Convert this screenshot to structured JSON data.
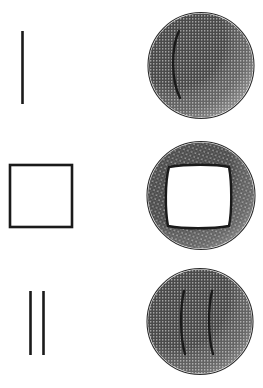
{
  "figure": {
    "width": 263,
    "height": 388,
    "background_color": "#ffffff",
    "ink_color": "#1a1a1a",
    "stipple_color": "#4a4a4a",
    "outline_color": "#2b2b2b",
    "rows": [
      {
        "id": "row-1",
        "label": "single-stroke",
        "left_mark": {
          "name": "single-vertical-line",
          "type": "line",
          "count": 1,
          "x1": 22.5,
          "y1": 31,
          "x2": 22.5,
          "y2": 104,
          "stroke_width": 2.6
        },
        "right_sphere": {
          "name": "sphere-single-stroke",
          "cx": 201,
          "cy": 65.5,
          "r": 53,
          "outline_width": 1.1,
          "interior_marks": [
            {
              "type": "arc",
              "d": "M 179,31 C 171,48 171,80 180,98",
              "stroke_width": 2.4
            }
          ],
          "shading": {
            "style": "stipple",
            "lit_side": "left",
            "shadow_side": "right-bottom",
            "density": "heavy"
          }
        }
      },
      {
        "id": "row-2",
        "label": "square-outline",
        "left_mark": {
          "name": "square-outline",
          "type": "rect",
          "x": 10,
          "y": 165,
          "width": 62,
          "height": 62,
          "stroke_width": 2.6
        },
        "right_sphere": {
          "name": "sphere-square-impression",
          "cx": 201,
          "cy": 195.5,
          "r": 54,
          "outline_width": 1.1,
          "interior_marks": [
            {
              "type": "rounded-square",
              "d": "M 169,167 C 186,164 216,164 229,167 C 232,183 232,211 229,226 C 212,229 184,229 168,226 C 165,210 165,182 169,167 Z",
              "stroke_width": 2.4
            }
          ],
          "shading": {
            "style": "stipple",
            "lit_side": "left",
            "shadow_side": "right-bottom",
            "density": "heavy"
          }
        }
      },
      {
        "id": "row-3",
        "label": "double-stroke",
        "left_mark": {
          "name": "double-vertical-lines",
          "type": "line",
          "count": 2,
          "x1": 30.5,
          "y1": 291,
          "x2": 30.5,
          "y2": 355,
          "x3": 43.5,
          "y3": 291,
          "x4": 43.5,
          "y4": 355,
          "stroke_width": 2.6
        },
        "right_sphere": {
          "name": "sphere-double-stroke",
          "cx": 200,
          "cy": 321.5,
          "r": 53,
          "outline_width": 1.1,
          "interior_marks": [
            {
              "type": "arc",
              "d": "M 184,291 C 180,308 180,337 185,354",
              "stroke_width": 2.4
            },
            {
              "type": "arc",
              "d": "M 212,291 C 208,308 208,337 213,354",
              "stroke_width": 2.4
            }
          ],
          "shading": {
            "style": "stipple",
            "lit_side": "left",
            "shadow_side": "right-bottom",
            "density": "heavy"
          }
        }
      }
    ]
  }
}
